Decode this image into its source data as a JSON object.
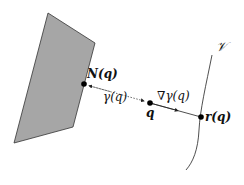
{
  "diagram": {
    "colors": {
      "polygon_fill": "#a6a6a6",
      "polygon_stroke": "#333333",
      "line": "#222222",
      "dot": "#000000"
    },
    "labels": {
      "manifold": "𝒱",
      "nearest_point": "N(q)",
      "distance": "γ(q)",
      "point": "q",
      "gradient": "∇γ(q)",
      "projection": "r(q)"
    },
    "nodes": [
      {
        "id": "N",
        "label": "N(q)",
        "x": 84,
        "y": 84
      },
      {
        "id": "q",
        "label": "q",
        "x": 150,
        "y": 103
      },
      {
        "id": "r",
        "label": "r(q)",
        "x": 201,
        "y": 117
      }
    ],
    "edges": [
      {
        "from": "q",
        "to": "N",
        "style": "dotted",
        "label": "γ(q)",
        "arrow": "both"
      },
      {
        "from": "q",
        "to": "r",
        "style": "solid",
        "label": "∇γ(q)",
        "arrow": "mid"
      }
    ]
  }
}
